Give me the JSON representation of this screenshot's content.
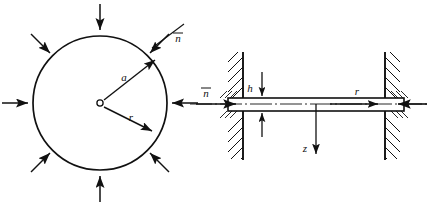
{
  "figure": {
    "background": "#ffffff",
    "stroke": "#111111",
    "panels": [
      {
        "id": "plan-view",
        "name": "circular-plate-plan-view",
        "description": "Circular plate of radius a under uniform radial in-plane compression",
        "center": {
          "x": 100,
          "y": 103
        },
        "radius": 67,
        "labels": {
          "radius_symbol": "a",
          "coordinate_symbol": "r",
          "normal_symbol": "n",
          "normal_overbar": true
        },
        "load_arrows_count": 8,
        "load_arrow_angles_deg": [
          0,
          45,
          90,
          135,
          180,
          225,
          270,
          315
        ],
        "load_direction": "inward",
        "radius_arrow_angle_deg": 35,
        "r_arrow_angle_deg": -28
      },
      {
        "id": "section-view",
        "name": "plate-cross-section-view",
        "description": "Side cross-section of the plate with clamped (hatched) supports at both edges",
        "plate": {
          "left": 228,
          "right": 404,
          "top": 98,
          "bottom": 111
        },
        "supports": [
          {
            "name": "left-support",
            "x": 243,
            "top": 52,
            "bottom": 160,
            "hatch_side": "left"
          },
          {
            "name": "right-support",
            "x": 385,
            "top": 52,
            "bottom": 160,
            "hatch_side": "right"
          }
        ],
        "labels": {
          "thickness_symbol": "h",
          "axial_symbol": "z",
          "radial_symbol": "r",
          "normal_symbol": "n",
          "normal_overbar": true
        },
        "thickness_dim_x": 262,
        "z_axis_x": 316,
        "z_axis_bottom": 156,
        "r_arrow": {
          "x1": 330,
          "x2": 480,
          "y": 104
        },
        "centerline_y": 104
      }
    ]
  }
}
